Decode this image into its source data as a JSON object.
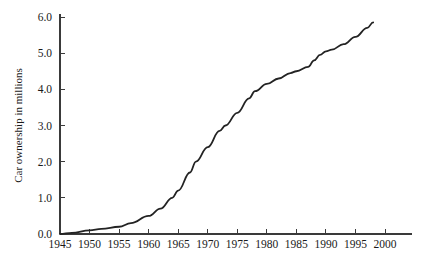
{
  "chart_data": {
    "type": "line",
    "title": "",
    "xlabel": "",
    "ylabel": "Car ownership in millions",
    "xlim": [
      1945,
      2001
    ],
    "ylim": [
      0.0,
      6.0
    ],
    "grid": false,
    "legend": "none",
    "x_ticks": [
      1945,
      1950,
      1955,
      1960,
      1965,
      1970,
      1975,
      1980,
      1985,
      1990,
      1995,
      2000
    ],
    "x_tick_labels": [
      "1945",
      "1950",
      "1955",
      "1960",
      "1965",
      "1970",
      "1975",
      "1980",
      "1985",
      "1990",
      "1995",
      "2000"
    ],
    "y_ticks": [
      0.0,
      1.0,
      2.0,
      3.0,
      4.0,
      5.0,
      6.0
    ],
    "y_tick_labels": [
      "0.0",
      "1.0",
      "2.0",
      "3.0",
      "4.0",
      "5.0",
      "6.0"
    ],
    "series": [
      {
        "name": "Car ownership",
        "color": "#232323",
        "x": [
          1945,
          1947,
          1950,
          1952,
          1955,
          1957,
          1960,
          1962,
          1964,
          1965,
          1967,
          1968,
          1970,
          1972,
          1973,
          1975,
          1977,
          1978,
          1980,
          1982,
          1984,
          1985,
          1987,
          1988,
          1989,
          1990,
          1991,
          1993,
          1995,
          1997,
          1998
        ],
        "y": [
          0.0,
          0.03,
          0.1,
          0.14,
          0.2,
          0.3,
          0.5,
          0.7,
          1.0,
          1.2,
          1.7,
          2.0,
          2.4,
          2.85,
          3.0,
          3.35,
          3.75,
          3.95,
          4.15,
          4.3,
          4.45,
          4.5,
          4.62,
          4.8,
          4.95,
          5.05,
          5.1,
          5.25,
          5.45,
          5.7,
          5.85
        ]
      }
    ]
  },
  "axes": {
    "y_axis_name": "car-ownership-axis",
    "x_axis_name": "year-axis"
  }
}
